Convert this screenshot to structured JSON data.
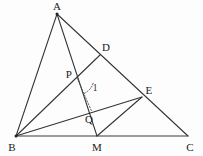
{
  "figure": {
    "type": "geometry-diagram",
    "background_color": "#fdfdfd",
    "line_color": "#333333",
    "label_color": "#1a1a1a",
    "width": 203,
    "height": 156,
    "points": [
      {
        "id": "A",
        "label": "A",
        "x": 57,
        "y": 14,
        "label_x": 57,
        "label_y": 6,
        "show_dot": true
      },
      {
        "id": "B",
        "label": "B",
        "x": 16,
        "y": 136,
        "label_x": 12,
        "label_y": 147,
        "show_dot": true
      },
      {
        "id": "C",
        "label": "C",
        "x": 188,
        "y": 136,
        "label_x": 190,
        "label_y": 147,
        "show_dot": false
      },
      {
        "id": "M",
        "label": "M",
        "x": 97,
        "y": 136,
        "label_x": 97,
        "label_y": 147,
        "show_dot": false
      },
      {
        "id": "D",
        "label": "D",
        "x": 100,
        "y": 55,
        "label_x": 106,
        "label_y": 47,
        "show_dot": false
      },
      {
        "id": "E",
        "label": "E",
        "x": 142,
        "y": 97,
        "label_x": 149,
        "label_y": 90,
        "show_dot": false
      },
      {
        "id": "P",
        "label": "P",
        "x": 77,
        "y": 78,
        "label_x": 69,
        "label_y": 74,
        "show_dot": false
      },
      {
        "id": "Q",
        "label": "Q",
        "x": 92,
        "y": 112,
        "label_x": 89,
        "label_y": 119,
        "show_dot": false
      }
    ],
    "segments": [
      {
        "id": "AB",
        "from": "A",
        "to": "B",
        "style": "solid"
      },
      {
        "id": "AC",
        "from": "A",
        "to": "C",
        "style": "solid"
      },
      {
        "id": "BC",
        "from": "B",
        "to": "C",
        "style": "solid"
      },
      {
        "id": "AM",
        "from": "A",
        "to": "M",
        "style": "solid"
      },
      {
        "id": "BD",
        "from": "B",
        "to": "D",
        "style": "solid"
      },
      {
        "id": "BE",
        "from": "B",
        "to": "E",
        "style": "solid"
      },
      {
        "id": "ME",
        "from": "M",
        "to": "E",
        "style": "solid"
      },
      {
        "id": "PQ",
        "from": "P",
        "to": "Q",
        "style": "dotted"
      }
    ],
    "angle_marks": [
      {
        "id": "angle-1",
        "label": "1",
        "at": "P",
        "label_x": 95,
        "label_y": 89,
        "arc": {
          "cx": 77,
          "cy": 78,
          "r": 17,
          "start_deg": 18,
          "end_deg": 66
        }
      }
    ]
  }
}
